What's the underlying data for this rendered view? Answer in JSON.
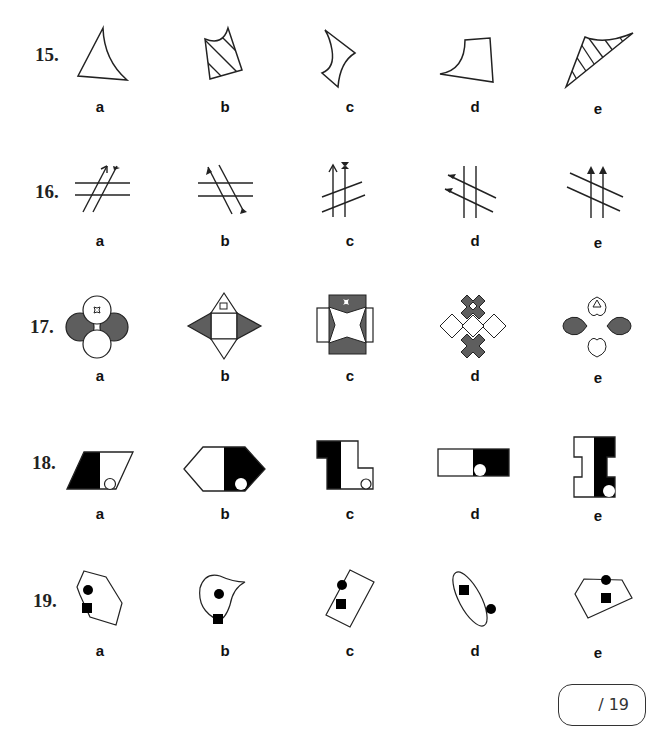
{
  "page": {
    "questions": [
      {
        "number": "15.",
        "options": [
          "a",
          "b",
          "c",
          "d",
          "e"
        ],
        "figures": [
          "curved-triangle",
          "hatched-notched-quad",
          "concave-curved-kite",
          "curved-quad",
          "hatched-curved-triangle"
        ]
      },
      {
        "number": "16.",
        "options": [
          "a",
          "b",
          "c",
          "d",
          "e"
        ],
        "figures": [
          "two-diagonal-arrows-across-horizontal-lines",
          "two-diagonal-lines-across-horizontal-lines",
          "two-vertical-arrows-across-diagonal-lines",
          "two-diagonal-arrows-across-vertical-lines",
          "two-vertical-arrows-across-diagonal-lines"
        ]
      },
      {
        "number": "17.",
        "options": [
          "a",
          "b",
          "c",
          "d",
          "e"
        ],
        "figures": [
          "four-circles",
          "square-with-triangles",
          "square-with-star-cutout",
          "crosses-cluster",
          "hearts-cluster"
        ]
      },
      {
        "number": "18.",
        "options": [
          "a",
          "b",
          "c",
          "d",
          "e"
        ],
        "figures": [
          "half-filled-parallelogram-with-circle",
          "half-filled-hexagon-with-circle",
          "half-filled-L-shape-with-circle",
          "half-filled-rectangle-with-circle",
          "half-filled-I-shape-with-circle"
        ]
      },
      {
        "number": "19.",
        "options": [
          "a",
          "b",
          "c",
          "d",
          "e"
        ],
        "figures": [
          "hexagon-with-dot-and-square",
          "teardrop-with-dot-and-square",
          "rectangle-with-dot-and-square",
          "ellipse-with-square-and-dot",
          "pentagon-with-dot-and-square"
        ]
      }
    ],
    "score": "/ 19"
  },
  "colors": {
    "fill_dark": "#5e5e5e",
    "fill_black": "#000000",
    "stroke": "#222222"
  }
}
